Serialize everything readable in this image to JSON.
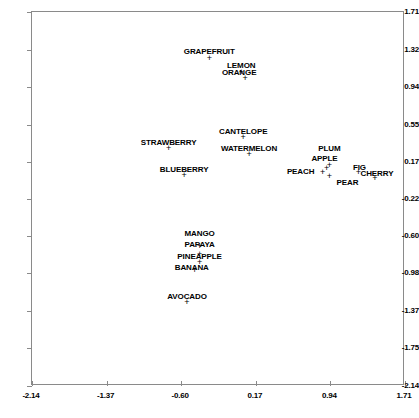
{
  "chart_data": {
    "type": "scatter",
    "title": "",
    "subtitle": "",
    "xlabel": "",
    "ylabel": "",
    "xlim": [
      -2.14,
      1.71
    ],
    "ylim": [
      -2.14,
      1.71
    ],
    "grid": false,
    "legend": "none",
    "marker_symbol": "+",
    "marker_color": "#000000",
    "xticks": [
      "-2.14",
      "-1.37",
      "-0.60",
      "0.17",
      "0.94",
      "1.71"
    ],
    "xtick_values": [
      -2.14,
      -1.37,
      -0.6,
      0.17,
      0.94,
      1.71
    ],
    "yticks": [
      "-2.14",
      "-1.75",
      "-1.37",
      "-0.98",
      "-0.60",
      "-0.22",
      "0.17",
      "0.55",
      "0.94",
      "1.32",
      "1.71"
    ],
    "ytick_values": [
      -2.14,
      -1.75,
      -1.37,
      -0.98,
      -0.6,
      -0.22,
      0.17,
      0.55,
      0.94,
      1.32,
      1.71
    ],
    "points": [
      {
        "label": "GRAPEFRUIT",
        "x": -0.31,
        "y": 1.24,
        "label_dx": 0,
        "label_dy": -11
      },
      {
        "label": "LEMON",
        "x": 0.02,
        "y": 1.09,
        "label_dx": 0,
        "label_dy": -11
      },
      {
        "label": "ORANGE",
        "x": 0.06,
        "y": 1.03,
        "label_dx": -6,
        "label_dy": -10
      },
      {
        "label": "CANTELOPE",
        "x": 0.04,
        "y": 0.42,
        "label_dx": 0,
        "label_dy": -10
      },
      {
        "label": "WATERMELON",
        "x": 0.1,
        "y": 0.25,
        "label_dx": 0,
        "label_dy": -10
      },
      {
        "label": "STRAWBERRY",
        "x": -0.73,
        "y": 0.31,
        "label_dx": 0,
        "label_dy": -10
      },
      {
        "label": "BLUEBERRY",
        "x": -0.57,
        "y": 0.03,
        "label_dx": 0,
        "label_dy": -10
      },
      {
        "label": "PLUM",
        "x": 0.93,
        "y": 0.13,
        "label_dx": 0,
        "label_dy": -21
      },
      {
        "label": "APPLE",
        "x": 0.9,
        "y": 0.1,
        "label_dx": -2,
        "label_dy": -14
      },
      {
        "label": "PEACH",
        "x": 0.86,
        "y": 0.06,
        "label_dx": -22,
        "label_dy": -5
      },
      {
        "label": "PEAR",
        "x": 0.93,
        "y": 0.02,
        "label_dx": 18,
        "label_dy": 2
      },
      {
        "label": "FIG",
        "x": 1.23,
        "y": 0.06,
        "label_dx": 1,
        "label_dy": -9
      },
      {
        "label": "CHERRY",
        "x": 1.4,
        "y": 0.0,
        "label_dx": 2,
        "label_dy": -9
      },
      {
        "label": "MANGO",
        "x": -0.41,
        "y": -0.7,
        "label_dx": 0,
        "label_dy": -17
      },
      {
        "label": "PAPAYA",
        "x": -0.41,
        "y": -0.78,
        "label_dx": 0,
        "label_dy": -14
      },
      {
        "label": "PINEAPPLE",
        "x": -0.41,
        "y": -0.86,
        "label_dx": 0,
        "label_dy": -10
      },
      {
        "label": "BANANA",
        "x": -0.46,
        "y": -0.95,
        "label_dx": -3,
        "label_dy": -7
      },
      {
        "label": "AVOCADO",
        "x": -0.54,
        "y": -1.28,
        "label_dx": 0,
        "label_dy": -10
      }
    ]
  }
}
